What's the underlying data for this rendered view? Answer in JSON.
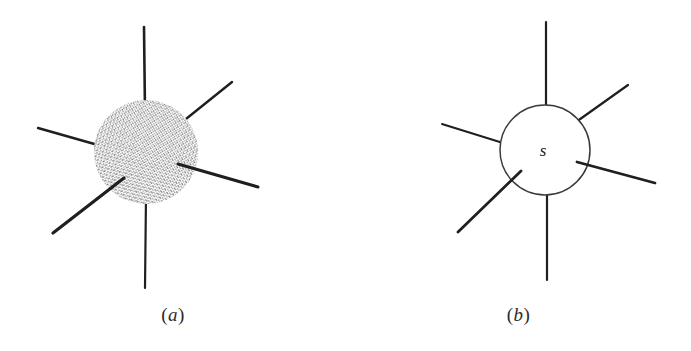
{
  "figure": {
    "background_color": "#ffffff",
    "ink_color": "#1f1f1f",
    "stipple_color": "#4a4a4a",
    "outline_color": "#3a3a3a",
    "panels": [
      {
        "id": "a",
        "caption": "(a)",
        "caption_open": "(",
        "caption_letter": "a",
        "caption_close": ")",
        "node_style": "stippled-sphere",
        "node_label": "",
        "center": {
          "x": 146,
          "y": 152
        },
        "node_radius": 52,
        "bond_count": 6,
        "bonds": [
          {
            "name": "bond-top",
            "x1": 144,
            "y1": 27,
            "x2": 145,
            "y2": 112,
            "width": 2.6
          },
          {
            "name": "bond-upper-right",
            "x1": 232,
            "y1": 82,
            "x2": 176,
            "y2": 127,
            "width": 2.4
          },
          {
            "name": "bond-right",
            "x1": 258,
            "y1": 187,
            "x2": 180,
            "y2": 165,
            "width": 3.0
          },
          {
            "name": "bond-bottom",
            "x1": 145,
            "y1": 288,
            "x2": 146,
            "y2": 196,
            "width": 2.2
          },
          {
            "name": "bond-lower-left",
            "x1": 53,
            "y1": 233,
            "x2": 124,
            "y2": 178,
            "width": 3.2
          },
          {
            "name": "bond-left",
            "x1": 38,
            "y1": 128,
            "x2": 110,
            "y2": 148,
            "width": 2.4
          }
        ]
      },
      {
        "id": "b",
        "caption": "(b)",
        "caption_open": "(",
        "caption_letter": "b",
        "caption_close": ")",
        "node_style": "open-circle",
        "node_label": "s",
        "center": {
          "x": 199,
          "y": 150
        },
        "node_radius": 45,
        "bond_count": 6,
        "bonds": [
          {
            "name": "bond-top",
            "x1": 200,
            "y1": 22,
            "x2": 200,
            "y2": 105,
            "width": 2.2
          },
          {
            "name": "bond-upper-right",
            "x1": 282,
            "y1": 85,
            "x2": 229,
            "y2": 122,
            "width": 2.2
          },
          {
            "name": "bond-right",
            "x1": 309,
            "y1": 183,
            "x2": 231,
            "y2": 162,
            "width": 2.8
          },
          {
            "name": "bond-bottom",
            "x1": 201,
            "y1": 280,
            "x2": 201,
            "y2": 195,
            "width": 2.2
          },
          {
            "name": "bond-lower-left",
            "x1": 112,
            "y1": 232,
            "x2": 174,
            "y2": 172,
            "width": 2.8
          },
          {
            "name": "bond-left",
            "x1": 96,
            "y1": 124,
            "x2": 157,
            "y2": 143,
            "width": 2.0
          }
        ],
        "label_position": {
          "x": 197,
          "y": 155
        }
      }
    ]
  }
}
